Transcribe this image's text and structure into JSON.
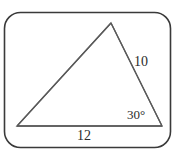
{
  "figure": {
    "kind": "geometry-diagram",
    "background_color": "#ffffff",
    "stroke_color": "#5a5a5a",
    "frame_stroke_color": "#3a3a3a",
    "text_color": "#2b2b2b",
    "frame": {
      "name": "rounded-rectangle-border",
      "x": 4.5,
      "y": 12.5,
      "width": 166,
      "height": 135,
      "corner_radius": 16,
      "stroke_width": 1.6
    },
    "triangle": {
      "name": "triangle-shape",
      "stroke_width": 1.3,
      "vertices": [
        {
          "name": "apex-vertex",
          "x": 111,
          "y": 23
        },
        {
          "name": "bottom-right-vertex",
          "x": 162,
          "y": 126
        },
        {
          "name": "bottom-left-vertex",
          "x": 17,
          "y": 126
        }
      ],
      "sides": [
        {
          "name": "left-side",
          "from": "bottom-left-vertex",
          "to": "apex-vertex",
          "label": ""
        },
        {
          "name": "right-side",
          "from": "apex-vertex",
          "to": "bottom-right-vertex",
          "label": "10"
        },
        {
          "name": "bottom-side",
          "from": "bottom-left-vertex",
          "to": "bottom-right-vertex",
          "label": "12"
        }
      ]
    },
    "labels": {
      "side_right": "10",
      "side_bottom": "12",
      "angle_bottom_right": "30°"
    }
  }
}
